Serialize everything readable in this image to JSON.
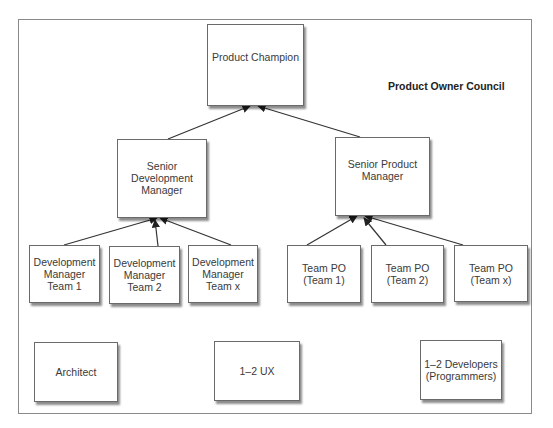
{
  "diagram": {
    "group_label": "Product Owner Council",
    "nodes": [
      {
        "id": "product-champion",
        "label": "Product Champion",
        "x": 207,
        "y": 24,
        "w": 97,
        "h": 82,
        "align": "top"
      },
      {
        "id": "senior-development-manager",
        "label": "Senior\nDevelopment\nManager",
        "x": 117,
        "y": 139,
        "w": 90,
        "h": 79,
        "align": "center-high"
      },
      {
        "id": "senior-product-manager",
        "label": "Senior Product\nManager",
        "x": 335,
        "y": 137,
        "w": 95,
        "h": 79,
        "align": "center-high"
      },
      {
        "id": "development-manager-team-1",
        "label": "Development\nManager\nTeam 1",
        "x": 29,
        "y": 245,
        "w": 71,
        "h": 58
      },
      {
        "id": "development-manager-team-2",
        "label": "Development\nManager\nTeam 2",
        "x": 109,
        "y": 246,
        "w": 71,
        "h": 58
      },
      {
        "id": "development-manager-team-x",
        "label": "Development\nManager\nTeam x",
        "x": 188,
        "y": 245,
        "w": 70,
        "h": 58
      },
      {
        "id": "team-po-team-1",
        "label": "Team PO\n(Team 1)",
        "x": 287,
        "y": 245,
        "w": 74,
        "h": 58
      },
      {
        "id": "team-po-team-2",
        "label": "Team PO\n(Team 2)",
        "x": 371,
        "y": 245,
        "w": 73,
        "h": 58
      },
      {
        "id": "team-po-team-x",
        "label": "Team PO\n(Team x)",
        "x": 454,
        "y": 245,
        "w": 74,
        "h": 57
      },
      {
        "id": "architect",
        "label": "Architect",
        "x": 34,
        "y": 342,
        "w": 84,
        "h": 60
      },
      {
        "id": "ux",
        "label": "1–2 UX",
        "x": 214,
        "y": 341,
        "w": 86,
        "h": 60
      },
      {
        "id": "developers",
        "label": "1–2 Developers\n(Programmers)",
        "x": 420,
        "y": 340,
        "w": 82,
        "h": 60
      }
    ],
    "edges": [
      {
        "from": "senior-development-manager",
        "to": "product-champion",
        "x1": 168,
        "y1": 139,
        "x2": 250,
        "y2": 106
      },
      {
        "from": "senior-product-manager",
        "to": "product-champion",
        "x1": 360,
        "y1": 137,
        "x2": 258,
        "y2": 106
      },
      {
        "from": "development-manager-team-1",
        "to": "senior-development-manager",
        "x1": 64,
        "y1": 245,
        "x2": 157,
        "y2": 218
      },
      {
        "from": "development-manager-team-2",
        "to": "senior-development-manager",
        "x1": 158,
        "y1": 246,
        "x2": 155,
        "y2": 220
      },
      {
        "from": "development-manager-team-x",
        "to": "senior-development-manager",
        "x1": 231,
        "y1": 245,
        "x2": 160,
        "y2": 218
      },
      {
        "from": "team-po-team-1",
        "to": "senior-product-manager",
        "x1": 307,
        "y1": 245,
        "x2": 357,
        "y2": 216
      },
      {
        "from": "team-po-team-2",
        "to": "senior-product-manager",
        "x1": 386,
        "y1": 245,
        "x2": 364,
        "y2": 218
      },
      {
        "from": "team-po-team-x",
        "to": "senior-product-manager",
        "x1": 463,
        "y1": 245,
        "x2": 365,
        "y2": 216
      }
    ],
    "colors": {
      "line": "#333333",
      "border": "#6a6a6a",
      "frame": "#8a8a8a"
    }
  }
}
